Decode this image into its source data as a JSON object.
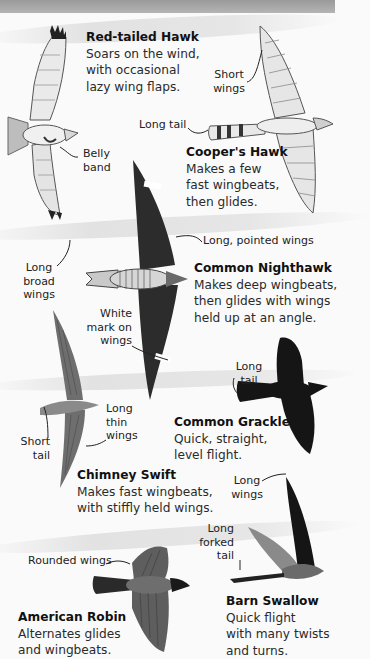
{
  "page": {
    "style": "grayscale field-guide illustration"
  },
  "birds": [
    {
      "name": "Red-tailed Hawk",
      "description_lines": [
        "Soars on the wind,",
        "with occasional",
        "lazy wing flaps."
      ],
      "labels": [
        {
          "lines": [
            "Belly",
            "band"
          ]
        },
        {
          "lines": [
            "Long",
            "broad",
            "wings"
          ]
        }
      ]
    },
    {
      "name": "Cooper's Hawk",
      "description_lines": [
        "Makes a few",
        "fast wingbeats,",
        "then glides."
      ],
      "labels": [
        {
          "lines": [
            "Short",
            "wings"
          ]
        },
        {
          "lines": [
            "Long tail"
          ]
        }
      ]
    },
    {
      "name": "Common Nighthawk",
      "description_lines": [
        "Makes deep wingbeats,",
        "then glides with wings",
        "held up at an angle."
      ],
      "labels": [
        {
          "lines": [
            "Long, pointed wings"
          ]
        },
        {
          "lines": [
            "White",
            "mark on",
            "wings"
          ]
        }
      ]
    },
    {
      "name": "Common Grackle",
      "description_lines": [
        "Quick, straight,",
        "level flight."
      ],
      "labels": [
        {
          "lines": [
            "Long",
            "tail"
          ]
        }
      ]
    },
    {
      "name": "Chimney Swift",
      "description_lines": [
        "Makes fast wingbeats,",
        "with stiffly held wings."
      ],
      "labels": [
        {
          "lines": [
            "Long",
            "thin",
            "wings"
          ]
        },
        {
          "lines": [
            "Short",
            "tail"
          ]
        }
      ]
    },
    {
      "name": "Barn Swallow",
      "description_lines": [
        "Quick flight",
        "with many twists",
        "and turns."
      ],
      "labels": [
        {
          "lines": [
            "Long",
            "wings"
          ]
        },
        {
          "lines": [
            "Long",
            "forked",
            "tail"
          ]
        }
      ]
    },
    {
      "name": "American Robin",
      "description_lines": [
        "Alternates glides",
        "and wingbeats."
      ],
      "labels": [
        {
          "lines": [
            "Rounded wings"
          ]
        }
      ]
    }
  ]
}
